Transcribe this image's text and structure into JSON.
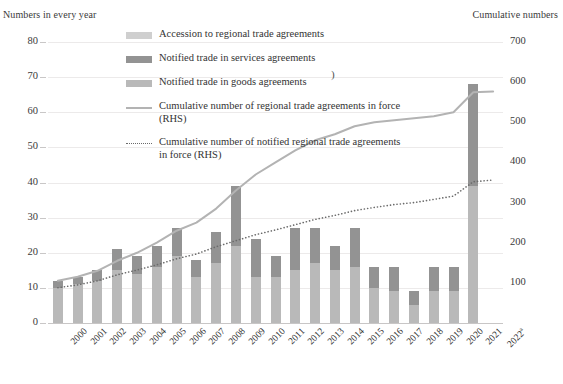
{
  "axis_captions": {
    "left": "Numbers in every year",
    "right": "Cumulative numbers"
  },
  "legend": {
    "items": [
      {
        "label": "Accession to regional trade agreements",
        "marker": "swatch",
        "color": "#cfcfcf"
      },
      {
        "label": "Notified trade in services agreements",
        "marker": "swatch",
        "color": "#939393"
      },
      {
        "label": "Notified trade in goods agreements",
        "marker": "swatch",
        "color": "#b9b9b9"
      },
      {
        "label": "Cumulative number of regional trade agreements in force (RHS)",
        "marker": "line",
        "color": "#b3b3b3"
      },
      {
        "label": "Cumulative number of notified regional trade agreements in force (RHS)",
        "marker": "dotted-line",
        "color": "#6b6b6b"
      }
    ],
    "stray_glyph": ")"
  },
  "chart_data": {
    "type": "bar",
    "title": "",
    "xlabel": "",
    "ylabel": "Numbers in every year",
    "y2label": "Cumulative numbers",
    "grid": true,
    "legend_position": "top-center",
    "ylim": [
      0,
      80
    ],
    "y2lim": [
      0,
      700
    ],
    "yticks": [
      0,
      10,
      20,
      30,
      40,
      50,
      60,
      70,
      80
    ],
    "y2ticks": [
      100,
      200,
      300,
      400,
      500,
      600,
      700
    ],
    "categories": [
      "2000",
      "2001",
      "2002",
      "2003",
      "2004",
      "2005",
      "2006",
      "2007",
      "2008",
      "2009",
      "2010",
      "2011",
      "2012",
      "2013",
      "2014",
      "2015",
      "2016",
      "2017",
      "2018",
      "2019",
      "2020",
      "2021",
      "2022a"
    ],
    "stacked": true,
    "series": [
      {
        "name": "Notified trade in goods agreements",
        "color": "#b9b9b9",
        "axis": "left",
        "values": [
          10,
          11,
          12,
          15,
          14,
          16,
          19,
          13,
          17,
          22,
          13,
          13,
          15,
          17,
          15,
          16,
          10,
          9,
          5,
          9,
          9,
          39,
          0
        ]
      },
      {
        "name": "Notified trade in services agreements",
        "color": "#939393",
        "axis": "left",
        "values": [
          2,
          2,
          3,
          6,
          5,
          6,
          8,
          5,
          9,
          17,
          11,
          6,
          12,
          10,
          7,
          11,
          6,
          7,
          4,
          7,
          7,
          29,
          0
        ]
      },
      {
        "name": "Accession to regional trade agreements",
        "color": "#cfcfcf",
        "axis": "left",
        "values": [
          0,
          0,
          0,
          0,
          0,
          0,
          0,
          0,
          0,
          0,
          0,
          0,
          0,
          0,
          0,
          0,
          0,
          0,
          0,
          0,
          0,
          0,
          0
        ]
      }
    ],
    "bar_totals": [
      12,
      13,
      15,
      21,
      19,
      22,
      27,
      18,
      26,
      39,
      24,
      19,
      27,
      27,
      22,
      27,
      16,
      16,
      9,
      16,
      16,
      68,
      0
    ],
    "lines": [
      {
        "name": "Cumulative number of regional trade agreements in force (RHS)",
        "color": "#b3b3b3",
        "style": "solid",
        "axis": "right",
        "values": [
          105,
          115,
          130,
          155,
          175,
          200,
          230,
          250,
          285,
          330,
          370,
          400,
          430,
          455,
          470,
          490,
          500,
          505,
          510,
          515,
          525,
          575,
          577
        ]
      },
      {
        "name": "Cumulative number of notified regional trade agreements in force (RHS)",
        "color": "#6b6b6b",
        "style": "dotted",
        "axis": "right",
        "values": [
          88,
          95,
          105,
          120,
          132,
          145,
          160,
          172,
          190,
          205,
          220,
          232,
          245,
          258,
          268,
          280,
          288,
          295,
          300,
          308,
          316,
          352,
          356
        ]
      }
    ]
  },
  "bottom_caption": ""
}
